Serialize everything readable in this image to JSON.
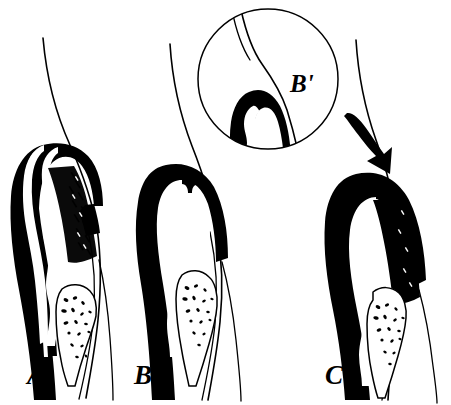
{
  "figure": {
    "background_color": "#ffffff",
    "ink_color": "#000000",
    "width": 451,
    "height": 405
  },
  "panels": [
    {
      "id": "panel-a",
      "label": "A",
      "label_x": 27,
      "label_y": 384,
      "description": "Tooth with gingival sulcus and calculus deposit on root surface"
    },
    {
      "id": "panel-b",
      "label": "B",
      "label_x": 134,
      "label_y": 384,
      "description": "Tooth with deepened periodontal pocket, no visible calculus band"
    },
    {
      "id": "panel-c",
      "label": "C",
      "label_x": 325,
      "label_y": 384,
      "description": "Tooth with advanced pocket, calculus deposit and probe arrow indicator"
    }
  ],
  "inset": {
    "id": "inset-b-prime",
    "label": "B'",
    "label_x": 290,
    "label_y": 92,
    "center_x": 268,
    "center_y": 79,
    "radius": 71,
    "description": "Magnified circular detail of panel B crest region"
  },
  "annotations": [
    {
      "id": "probe-arrow",
      "name": "down-arrow",
      "points_to": "panel-c crest",
      "tip_x": 388,
      "tip_y": 160
    }
  ],
  "legend": {
    "ink": "#000000",
    "paper": "#ffffff"
  }
}
